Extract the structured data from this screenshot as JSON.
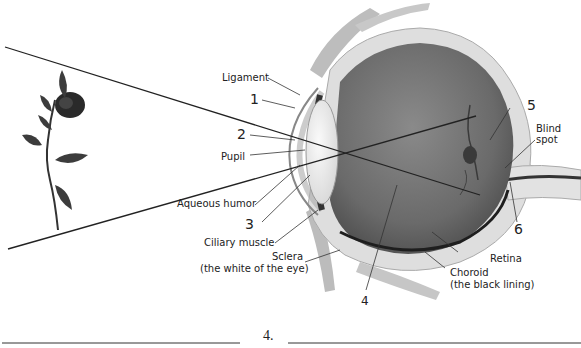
{
  "diagram": {
    "labels": {
      "ligament": "Ligament",
      "pupil": "Pupil",
      "aqueous_humor": "Aqueous humor",
      "ciliary_muscle": "Ciliary muscle",
      "sclera_line1": "Sclera",
      "sclera_line2": "(the white of the eye)",
      "retina": "Retina",
      "choroid_line1": "Choroid",
      "choroid_line2": "(the black lining)",
      "blind_spot_line1": "Blind",
      "blind_spot_line2": "spot"
    },
    "numbers": {
      "n1": "1",
      "n2": "2",
      "n3": "3",
      "n4": "4",
      "n5": "5",
      "n6": "6"
    },
    "object": "rose",
    "colors": {
      "line": "#222222",
      "eyeball": "#6e6e6e",
      "sclera": "#d8d8d8",
      "lens": "#f2f2f2"
    }
  },
  "answer_area": {
    "item_number": "4."
  }
}
